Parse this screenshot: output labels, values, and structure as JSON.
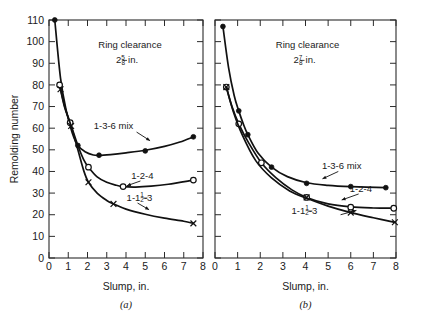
{
  "figure": {
    "title": "",
    "panel_a_letter": "(a)",
    "panel_b_letter": "(b)"
  },
  "chart_data": [
    {
      "type": "line",
      "panel": "(a)",
      "title": "",
      "annotation_line1": "Ring clearance",
      "annotation_line2_whole": "2",
      "annotation_line2_num": "5",
      "annotation_line2_den": "8",
      "annotation_line2_unit": "in.",
      "xlabel": "Slump, in.",
      "ylabel": "Remolding number",
      "xlim": [
        0,
        8
      ],
      "ylim": [
        0,
        110
      ],
      "xticks": [
        0,
        1,
        2,
        3,
        4,
        5,
        6,
        7,
        8
      ],
      "xticklabels": [
        "0",
        "1",
        "2",
        "3",
        "4",
        "5",
        "6",
        "7",
        "8"
      ],
      "yticks": [
        0,
        10,
        20,
        30,
        40,
        50,
        60,
        70,
        80,
        90,
        100,
        110
      ],
      "yticklabels": [
        "0",
        "10",
        "20",
        "30",
        "40",
        "50",
        "60",
        "70",
        "80",
        "90",
        "100",
        "110"
      ],
      "grid": false,
      "legend": "inline-labels",
      "series": [
        {
          "name": "1-3-6 mix",
          "marker": "filled-circle",
          "label": "1-3-6 mix",
          "label_x": 3.35,
          "label_y": 59.5,
          "leader_from": [
            4.55,
            58.2
          ],
          "leader_to": [
            5.25,
            54.2
          ],
          "points": [
            {
              "x": 0.3,
              "y": 110
            },
            {
              "x": 1.5,
              "y": 52
            },
            {
              "x": 2.6,
              "y": 47.5
            },
            {
              "x": 5.0,
              "y": 49.5
            },
            {
              "x": 7.5,
              "y": 56
            }
          ],
          "curve": [
            {
              "x": 0.3,
              "y": 110
            },
            {
              "x": 0.6,
              "y": 83
            },
            {
              "x": 0.9,
              "y": 68
            },
            {
              "x": 1.2,
              "y": 58
            },
            {
              "x": 1.5,
              "y": 52
            },
            {
              "x": 1.9,
              "y": 49
            },
            {
              "x": 2.3,
              "y": 47.6
            },
            {
              "x": 2.6,
              "y": 47.4
            },
            {
              "x": 3.2,
              "y": 47.8
            },
            {
              "x": 4.0,
              "y": 48.6
            },
            {
              "x": 5.0,
              "y": 49.8
            },
            {
              "x": 6.0,
              "y": 51.6
            },
            {
              "x": 6.8,
              "y": 53.6
            },
            {
              "x": 7.5,
              "y": 56
            }
          ]
        },
        {
          "name": "1-2-4",
          "marker": "open-circle",
          "label": "1-2-4",
          "label_x": 4.85,
          "label_y": 36.5,
          "leader_from": [
            4.75,
            35.6
          ],
          "leader_to": [
            4.05,
            33.4
          ],
          "points": [
            {
              "x": 0.55,
              "y": 80
            },
            {
              "x": 1.1,
              "y": 62.5
            },
            {
              "x": 2.05,
              "y": 42
            },
            {
              "x": 3.85,
              "y": 33
            },
            {
              "x": 7.5,
              "y": 36
            }
          ],
          "curve": [
            {
              "x": 0.55,
              "y": 80
            },
            {
              "x": 0.8,
              "y": 70
            },
            {
              "x": 1.1,
              "y": 62.5
            },
            {
              "x": 1.5,
              "y": 52
            },
            {
              "x": 1.8,
              "y": 45.5
            },
            {
              "x": 2.05,
              "y": 42
            },
            {
              "x": 2.5,
              "y": 37.5
            },
            {
              "x": 3.0,
              "y": 35
            },
            {
              "x": 3.5,
              "y": 33.6
            },
            {
              "x": 3.85,
              "y": 33
            },
            {
              "x": 4.5,
              "y": 32.8
            },
            {
              "x": 5.3,
              "y": 33.2
            },
            {
              "x": 6.2,
              "y": 34.1
            },
            {
              "x": 7.5,
              "y": 36
            }
          ]
        },
        {
          "name": "1-1½-3",
          "marker": "cross",
          "label_prefix": "1-1",
          "label_num": "1",
          "label_den": "2",
          "label_suffix": "-3",
          "label_x": 4.7,
          "label_y": 26.5,
          "leader_from": [
            4.6,
            25.4
          ],
          "leader_to": [
            5.2,
            22.3
          ],
          "points": [
            {
              "x": 0.6,
              "y": 78
            },
            {
              "x": 1.15,
              "y": 61
            },
            {
              "x": 2.05,
              "y": 35
            },
            {
              "x": 3.35,
              "y": 25
            },
            {
              "x": 7.5,
              "y": 16
            }
          ],
          "curve": [
            {
              "x": 0.6,
              "y": 78
            },
            {
              "x": 0.85,
              "y": 69
            },
            {
              "x": 1.15,
              "y": 61
            },
            {
              "x": 1.5,
              "y": 50
            },
            {
              "x": 1.8,
              "y": 40.5
            },
            {
              "x": 2.05,
              "y": 35
            },
            {
              "x": 2.5,
              "y": 30
            },
            {
              "x": 3.0,
              "y": 26.6
            },
            {
              "x": 3.35,
              "y": 25
            },
            {
              "x": 4.0,
              "y": 22.6
            },
            {
              "x": 5.0,
              "y": 20.2
            },
            {
              "x": 6.0,
              "y": 18.4
            },
            {
              "x": 7.0,
              "y": 17.0
            },
            {
              "x": 7.5,
              "y": 16
            }
          ]
        }
      ]
    },
    {
      "type": "line",
      "panel": "(b)",
      "title": "",
      "annotation_line1": "Ring clearance",
      "annotation_line2_whole": "2",
      "annotation_line2_num": "7",
      "annotation_line2_den": "8",
      "annotation_line2_unit": "in.",
      "xlabel": "Slump, in.",
      "ylabel": "",
      "xlim": [
        0,
        8
      ],
      "ylim": [
        0,
        110
      ],
      "xticks": [
        0,
        1,
        2,
        3,
        4,
        5,
        6,
        7,
        8
      ],
      "xticklabels": [
        "0",
        "1",
        "2",
        "3",
        "4",
        "5",
        "6",
        "7",
        "8"
      ],
      "yticks": [
        0,
        10,
        20,
        30,
        40,
        50,
        60,
        70,
        80,
        90,
        100,
        110
      ],
      "yticklabels": [],
      "grid": false,
      "legend": "inline-labels",
      "series": [
        {
          "name": "1-3-6 mix",
          "marker": "filled-circle",
          "label": "1-3-6 mix",
          "label_x": 5.6,
          "label_y": 41,
          "leader_from": [
            5.45,
            40.0
          ],
          "leader_to": [
            4.75,
            36.6
          ],
          "points": [
            {
              "x": 0.35,
              "y": 107
            },
            {
              "x": 1.05,
              "y": 68
            },
            {
              "x": 1.45,
              "y": 57
            },
            {
              "x": 2.5,
              "y": 42
            },
            {
              "x": 4.05,
              "y": 34.5
            },
            {
              "x": 6.0,
              "y": 33
            },
            {
              "x": 7.55,
              "y": 32.5
            }
          ],
          "curve": [
            {
              "x": 0.35,
              "y": 107
            },
            {
              "x": 0.6,
              "y": 88
            },
            {
              "x": 0.85,
              "y": 75
            },
            {
              "x": 1.05,
              "y": 68
            },
            {
              "x": 1.25,
              "y": 62
            },
            {
              "x": 1.45,
              "y": 57
            },
            {
              "x": 1.9,
              "y": 48.5
            },
            {
              "x": 2.5,
              "y": 42
            },
            {
              "x": 3.2,
              "y": 37.6
            },
            {
              "x": 4.05,
              "y": 34.8
            },
            {
              "x": 5.0,
              "y": 33.6
            },
            {
              "x": 6.0,
              "y": 33
            },
            {
              "x": 7.55,
              "y": 32.5
            }
          ]
        },
        {
          "name": "1-2-4",
          "marker": "open-circle",
          "label": "1-2-4",
          "label_x": 6.45,
          "label_y": 30.5,
          "leader_from": [
            6.35,
            29.6
          ],
          "leader_to": [
            5.6,
            26.8
          ],
          "points": [
            {
              "x": 0.5,
              "y": 79
            },
            {
              "x": 1.05,
              "y": 62
            },
            {
              "x": 2.05,
              "y": 44
            },
            {
              "x": 4.05,
              "y": 28
            },
            {
              "x": 6.0,
              "y": 23.5
            },
            {
              "x": 7.9,
              "y": 23
            }
          ],
          "curve": [
            {
              "x": 0.5,
              "y": 79
            },
            {
              "x": 0.75,
              "y": 70
            },
            {
              "x": 1.05,
              "y": 62
            },
            {
              "x": 1.5,
              "y": 53
            },
            {
              "x": 2.05,
              "y": 44
            },
            {
              "x": 2.7,
              "y": 37
            },
            {
              "x": 3.4,
              "y": 31.5
            },
            {
              "x": 4.05,
              "y": 28
            },
            {
              "x": 5.0,
              "y": 25
            },
            {
              "x": 6.0,
              "y": 23.6
            },
            {
              "x": 7.0,
              "y": 23.1
            },
            {
              "x": 7.9,
              "y": 23
            }
          ]
        },
        {
          "name": "1-1½-3",
          "marker": "cross",
          "label_prefix": "1-1",
          "label_num": "1",
          "label_den": "2",
          "label_suffix": "-3",
          "label_x": 3.95,
          "label_y": 20.5,
          "leader_from": [
            5.55,
            20.0
          ],
          "leader_to": [
            6.25,
            22.0
          ],
          "points": [
            {
              "x": 0.5,
              "y": 79
            },
            {
              "x": 4.05,
              "y": 28
            },
            {
              "x": 6.0,
              "y": 21
            },
            {
              "x": 7.95,
              "y": 16.5
            }
          ],
          "curve": [
            {
              "x": 0.5,
              "y": 79
            },
            {
              "x": 0.8,
              "y": 68
            },
            {
              "x": 1.2,
              "y": 57
            },
            {
              "x": 1.8,
              "y": 45
            },
            {
              "x": 2.5,
              "y": 37
            },
            {
              "x": 3.3,
              "y": 31
            },
            {
              "x": 4.05,
              "y": 27.6
            },
            {
              "x": 5.0,
              "y": 24
            },
            {
              "x": 6.0,
              "y": 21
            },
            {
              "x": 7.0,
              "y": 18.6
            },
            {
              "x": 7.95,
              "y": 16.5
            }
          ]
        }
      ]
    }
  ]
}
